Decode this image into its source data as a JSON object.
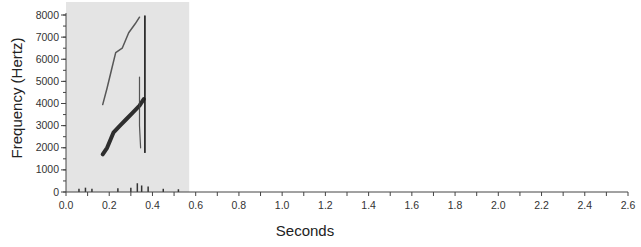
{
  "chart_data": {
    "type": "heatmap",
    "subtype": "spectrogram",
    "title": "",
    "xlabel": "Seconds",
    "ylabel": "Frequency (Hertz)",
    "xlim": [
      0.0,
      2.6
    ],
    "ylim": [
      0,
      8000
    ],
    "x_ticks": [
      "0.0",
      "0.2",
      "0.4",
      "0.6",
      "0.8",
      "1.0",
      "1.2",
      "1.4",
      "1.6",
      "1.8",
      "2.0",
      "2.2",
      "2.4",
      "2.6"
    ],
    "x_tick_values": [
      0.0,
      0.2,
      0.4,
      0.6,
      0.8,
      1.0,
      1.2,
      1.4,
      1.6,
      1.8,
      2.0,
      2.2,
      2.4,
      2.6
    ],
    "x_minor_tick_step": 0.1,
    "y_ticks": [
      "0",
      "1000",
      "2000",
      "3000",
      "4000",
      "5000",
      "6000",
      "7000",
      "8000"
    ],
    "y_tick_values": [
      0,
      1000,
      2000,
      3000,
      4000,
      5000,
      6000,
      7000,
      8000
    ],
    "y_minor_tick_step": 500,
    "grid": false,
    "legend": null,
    "recorded_region": {
      "t_start": 0.0,
      "t_end": 0.57,
      "f_min": 0,
      "f_max": 8000,
      "background": "#e4e4e4"
    },
    "series": [
      {
        "name": "fundamental (rising call)",
        "points": [
          [
            0.17,
            1700
          ],
          [
            0.19,
            2000
          ],
          [
            0.22,
            2700
          ],
          [
            0.25,
            3000
          ],
          [
            0.28,
            3300
          ],
          [
            0.31,
            3600
          ],
          [
            0.34,
            3900
          ],
          [
            0.36,
            4200
          ]
        ]
      },
      {
        "name": "harmonic",
        "points": [
          [
            0.17,
            3950
          ],
          [
            0.19,
            4700
          ],
          [
            0.21,
            5500
          ],
          [
            0.23,
            6300
          ],
          [
            0.26,
            6500
          ],
          [
            0.29,
            7200
          ],
          [
            0.32,
            7600
          ],
          [
            0.34,
            7900
          ]
        ]
      },
      {
        "name": "vertical transient",
        "points": [
          [
            0.365,
            7950
          ],
          [
            0.365,
            5500
          ],
          [
            0.365,
            3000
          ],
          [
            0.365,
            1800
          ]
        ]
      },
      {
        "name": "vertical transient 2",
        "points": [
          [
            0.34,
            5200
          ],
          [
            0.34,
            3000
          ],
          [
            0.345,
            2000
          ]
        ]
      },
      {
        "name": "low-frequency noise",
        "points": [
          [
            0.06,
            100
          ],
          [
            0.09,
            150
          ],
          [
            0.12,
            100
          ],
          [
            0.24,
            120
          ],
          [
            0.3,
            150
          ],
          [
            0.33,
            350
          ],
          [
            0.35,
            250
          ],
          [
            0.38,
            200
          ],
          [
            0.45,
            100
          ],
          [
            0.52,
            80
          ]
        ]
      }
    ]
  }
}
